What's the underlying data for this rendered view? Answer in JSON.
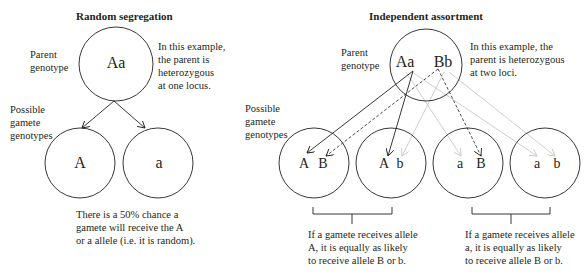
{
  "random_segregation": {
    "title": "Random segregation",
    "parent_label_1": "Parent",
    "parent_label_2": "genotype",
    "parent_genotype": "Aa",
    "note_lines": [
      "In this example,",
      "the parent is",
      "heterozygous",
      "at one locus."
    ],
    "gamete_label_lines": [
      "Possible",
      "gamete",
      "genotypes"
    ],
    "gametes": [
      "A",
      "a"
    ],
    "caption_lines": [
      "There is a 50% chance a",
      "gamete will receive the A",
      "or a allele (i.e. it is random)."
    ]
  },
  "independent_assortment": {
    "title": "Independent assortment",
    "parent_label_1": "Parent",
    "parent_label_2": "genotype",
    "parent_alleles": [
      "Aa",
      "Bb"
    ],
    "note_lines": [
      "In this example, the",
      "parent is heterozygous",
      "at two loci."
    ],
    "gamete_label_lines": [
      "Possible",
      "gamete",
      "genotypes"
    ],
    "gametes": [
      {
        "first": "A",
        "second": "B"
      },
      {
        "first": "A",
        "second": "b"
      },
      {
        "first": "a",
        "second": "B"
      },
      {
        "first": "a",
        "second": "b"
      }
    ],
    "caption_left_lines": [
      "If a gamete receives allele",
      "A, it is equally as likely",
      "to receive allele B or b."
    ],
    "caption_right_lines": [
      "If a gamete receives allele",
      "a, it is equally as likely",
      "to receive allele B or b."
    ]
  },
  "colors": {
    "line": "#231f20",
    "arrow_gray": "#c8c8c8"
  }
}
